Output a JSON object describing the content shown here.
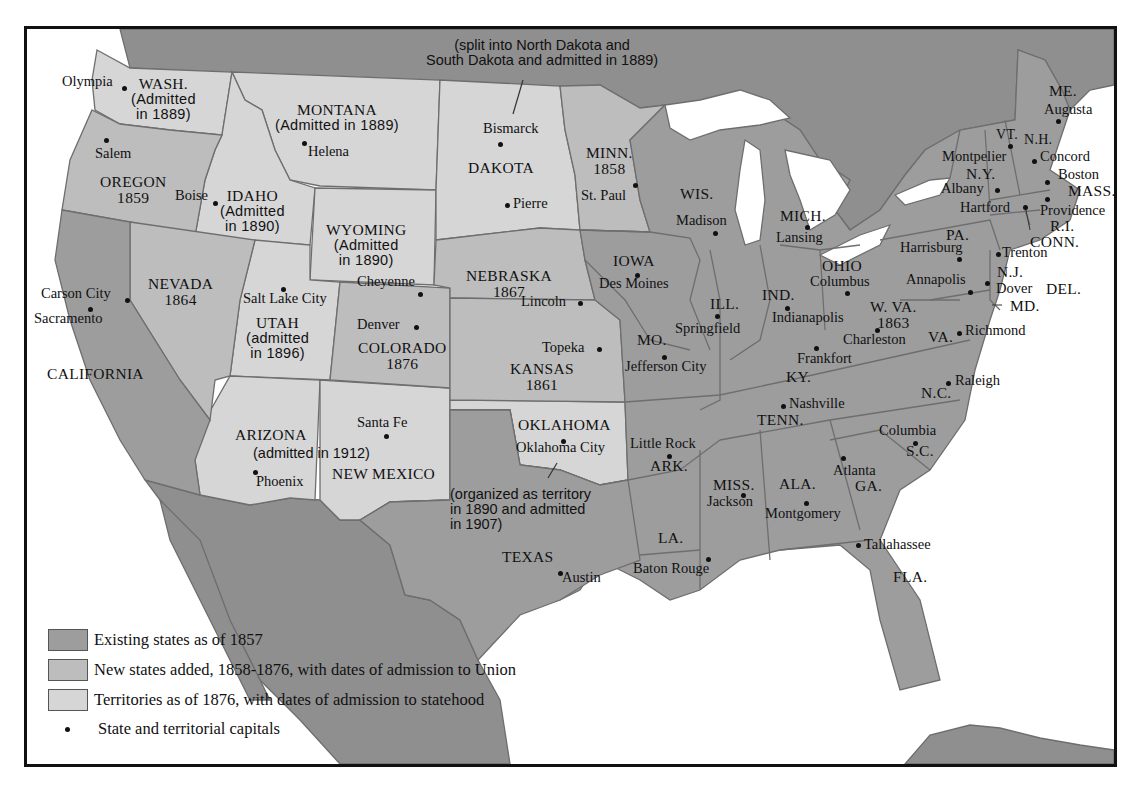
{
  "colors": {
    "existing_1857": "#9d9d9d",
    "new_1858_1876": "#bdbdbd",
    "territories_1876": "#d6d6d6",
    "foreign_land": "#8f8f8f",
    "water": "#ffffff",
    "border": "#6e6e6e"
  },
  "notes": {
    "dakota_split_line1": "(split into North Dakota and",
    "dakota_split_line2": "South Dakota and admitted in 1889)",
    "oklahoma_line1": "(organized as territory",
    "oklahoma_line2": "in 1890 and admitted",
    "oklahoma_line3": "in 1907)"
  },
  "states": {
    "wash": {
      "name": "WASH.",
      "note1": "(Admitted",
      "note2": "in 1889)"
    },
    "montana": {
      "name": "MONTANA",
      "note1": "(Admitted in 1889)"
    },
    "oregon": {
      "name": "OREGON",
      "year": "1859"
    },
    "idaho": {
      "name": "IDAHO",
      "note1": "(Admitted",
      "note2": "in 1890)"
    },
    "wyoming": {
      "name": "WYOMING",
      "note1": "(Admitted",
      "note2": "in 1890)"
    },
    "dakota": {
      "name": "DAKOTA"
    },
    "minn": {
      "name": "MINN.",
      "year": "1858"
    },
    "wis": {
      "name": "WIS."
    },
    "mich": {
      "name": "MICH."
    },
    "me": {
      "name": "ME."
    },
    "vt": {
      "name": "VT."
    },
    "nh": {
      "name": "N.H."
    },
    "ny": {
      "name": "N.Y."
    },
    "mass": {
      "name": "MASS."
    },
    "ri": {
      "name": "R.I."
    },
    "conn": {
      "name": "CONN."
    },
    "pa": {
      "name": "PA."
    },
    "nj": {
      "name": "N.J."
    },
    "del": {
      "name": "DEL."
    },
    "md": {
      "name": "MD."
    },
    "nevada": {
      "name": "NEVADA",
      "year": "1864"
    },
    "utah": {
      "name": "UTAH",
      "note1": "(admitted",
      "note2": "in 1896)"
    },
    "colorado": {
      "name": "COLORADO",
      "year": "1876"
    },
    "nebraska": {
      "name": "NEBRASKA",
      "year": "1867"
    },
    "kansas": {
      "name": "KANSAS",
      "year": "1861"
    },
    "iowa": {
      "name": "IOWA"
    },
    "ill": {
      "name": "ILL."
    },
    "ind": {
      "name": "IND."
    },
    "ohio": {
      "name": "OHIO"
    },
    "wva": {
      "name": "W. VA.",
      "year": "1863"
    },
    "va": {
      "name": "VA."
    },
    "mo": {
      "name": "MO."
    },
    "ky": {
      "name": "KY."
    },
    "tenn": {
      "name": "TENN."
    },
    "nc": {
      "name": "N.C."
    },
    "sc": {
      "name": "S.C."
    },
    "california": {
      "name": "CALIFORNIA"
    },
    "arizona": {
      "name": "ARIZONA",
      "note1": "(admitted in 1912)"
    },
    "new_mexico": {
      "name": "NEW MEXICO"
    },
    "oklahoma": {
      "name": "OKLAHOMA"
    },
    "ark": {
      "name": "ARK."
    },
    "miss": {
      "name": "MISS."
    },
    "ala": {
      "name": "ALA."
    },
    "ga": {
      "name": "GA."
    },
    "texas": {
      "name": "TEXAS"
    },
    "la": {
      "name": "LA."
    },
    "fla": {
      "name": "FLA."
    }
  },
  "capitals": {
    "olympia": "Olympia",
    "salem": "Salem",
    "helena": "Helena",
    "boise": "Boise",
    "bismarck": "Bismarck",
    "pierre": "Pierre",
    "st_paul": "St. Paul",
    "madison": "Madison",
    "lansing": "Lansing",
    "augusta": "Augusta",
    "montpelier": "Montpelier",
    "concord": "Concord",
    "boston": "Boston",
    "albany": "Albany",
    "hartford": "Hartford",
    "providence": "Providence",
    "harrisburg": "Harrisburg",
    "trenton": "Trenton",
    "annapolis": "Annapolis",
    "dover": "Dover",
    "carson_city": "Carson City",
    "sacramento": "Sacramento",
    "salt_lake_city": "Salt Lake City",
    "cheyenne": "Cheyenne",
    "denver": "Denver",
    "lincoln": "Lincoln",
    "topeka": "Topeka",
    "des_moines": "Des Moines",
    "springfield": "Springfield",
    "jefferson_city": "Jefferson City",
    "indianapolis": "Indianapolis",
    "columbus": "Columbus",
    "charleston": "Charleston",
    "richmond": "Richmond",
    "frankfort": "Frankfort",
    "nashville": "Nashville",
    "raleigh": "Raleigh",
    "columbia": "Columbia",
    "santa_fe": "Santa Fe",
    "phoenix": "Phoenix",
    "oklahoma_city": "Oklahoma City",
    "little_rock": "Little Rock",
    "jackson": "Jackson",
    "montgomery": "Montgomery",
    "atlanta": "Atlanta",
    "austin": "Austin",
    "baton_rouge": "Baton Rouge",
    "tallahassee": "Tallahassee"
  },
  "legend": {
    "items": [
      {
        "label": "Existing states as of 1857",
        "swatch": "#9d9d9d"
      },
      {
        "label": "New states added, 1858-1876, with dates of admission to Union",
        "swatch": "#bdbdbd"
      },
      {
        "label": "Territories as of 1876, with dates of admission to statehood",
        "swatch": "#d6d6d6"
      },
      {
        "label": "State and territorial capitals",
        "swatch": "dot"
      }
    ]
  }
}
